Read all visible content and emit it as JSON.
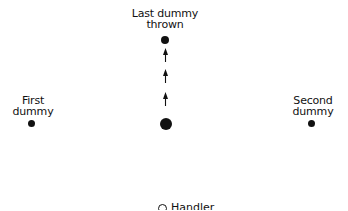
{
  "diagram": {
    "labels": {
      "last_dummy": [
        "Last dummy",
        "thrown"
      ],
      "first_dummy": [
        "First",
        "dummy"
      ],
      "second_dummy": [
        "Second",
        "dummy"
      ],
      "handler": "Handler"
    },
    "nodes": [
      {
        "id": "last-dummy",
        "x": 165,
        "y": 40,
        "size": "small"
      },
      {
        "id": "first-dummy",
        "x": 32,
        "y": 124,
        "size": "small"
      },
      {
        "id": "second-dummy",
        "x": 312,
        "y": 124,
        "size": "small"
      },
      {
        "id": "dog-start",
        "x": 166,
        "y": 124,
        "size": "large"
      },
      {
        "id": "handler",
        "x": 164,
        "y": 206,
        "shape": "open-circle"
      }
    ],
    "arrows": {
      "count": 3,
      "direction": "up",
      "from": "dog-start",
      "to": "last-dummy"
    },
    "colors": {
      "ink": "#111111",
      "background": "#ffffff"
    }
  }
}
